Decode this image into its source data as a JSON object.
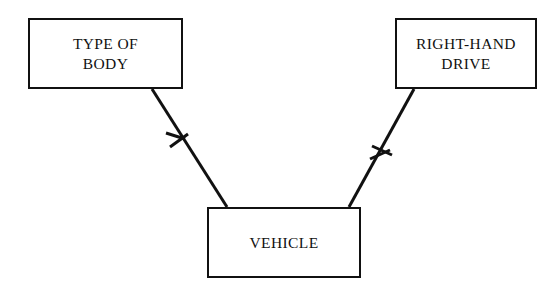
{
  "diagram": {
    "type": "entity-relationship-diagram",
    "notation": "crow's foot",
    "background_color": "#ffffff",
    "line_color": "#111111",
    "entities": [
      {
        "id": "type-of-body",
        "label": "TYPE OF\nBODY",
        "label_lines": [
          "TYPE OF",
          "BODY"
        ],
        "x": 28,
        "y": 18,
        "width": 155,
        "height": 71
      },
      {
        "id": "right-hand-drive",
        "label": "RIGHT-HAND\nDRIVE",
        "label_lines": [
          "RIGHT-HAND",
          "DRIVE"
        ],
        "x": 395,
        "y": 18,
        "width": 142,
        "height": 71
      },
      {
        "id": "vehicle",
        "label": "VEHICLE",
        "label_lines": [
          "VEHICLE"
        ],
        "x": 207,
        "y": 207,
        "width": 154,
        "height": 71
      }
    ],
    "relationships": [
      {
        "id": "type-of-body-to-vehicle",
        "from": "type-of-body",
        "to": "vehicle",
        "from_point": [
          152,
          89
        ],
        "to_point": [
          227,
          207
        ],
        "marker": "crow-foot",
        "marker_position": [
          178,
          140
        ]
      },
      {
        "id": "right-hand-drive-to-vehicle",
        "from": "right-hand-drive",
        "to": "vehicle",
        "from_point": [
          414,
          89
        ],
        "to_point": [
          349,
          207
        ],
        "marker": "crow-foot",
        "marker_position": [
          379,
          155
        ]
      }
    ]
  }
}
